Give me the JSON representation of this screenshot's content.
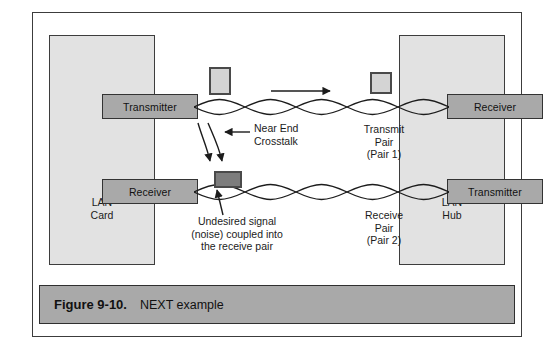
{
  "figure": {
    "number_label": "Figure 9-10.",
    "title": "NEXT example"
  },
  "devices": {
    "left": {
      "name_lines": "LAN\nCard",
      "blocks": [
        {
          "label": "Transmitter",
          "role": "transmitter"
        },
        {
          "label": "Receiver",
          "role": "receiver"
        }
      ]
    },
    "right": {
      "name_lines": "LAN\nHub",
      "blocks": [
        {
          "label": "Receiver",
          "role": "receiver"
        },
        {
          "label": "Transmitter",
          "role": "transmitter"
        }
      ]
    }
  },
  "cables": {
    "transmit": {
      "label": "Transmit\nPair\n(Pair 1)",
      "twists": 5,
      "direction": "left-to-right"
    },
    "receive": {
      "label": "Receive\nPair\n(Pair 2)",
      "twists": 5,
      "direction": "right-to-left"
    }
  },
  "annotations": {
    "crosstalk": {
      "label": "Near End\nCrosstalk"
    },
    "noise": {
      "label": "Undesired signal\n(noise) coupled into\nthe receive pair"
    }
  },
  "colors": {
    "frame_border": "#3c3c3c",
    "device_fill": "#e2e2e2",
    "device_border": "#3d3d3d",
    "transceiver_fill": "#a9a9a9",
    "transceiver_border": "#333333",
    "packet_light_fill": "#d4d4d4",
    "packet_dark_fill": "#7d7d7d",
    "packet_border": "#4a4a4a",
    "caption_bar_fill": "#a9a9a9",
    "wire_stroke": "#1c1c1c",
    "page_background": "#ffffff"
  }
}
